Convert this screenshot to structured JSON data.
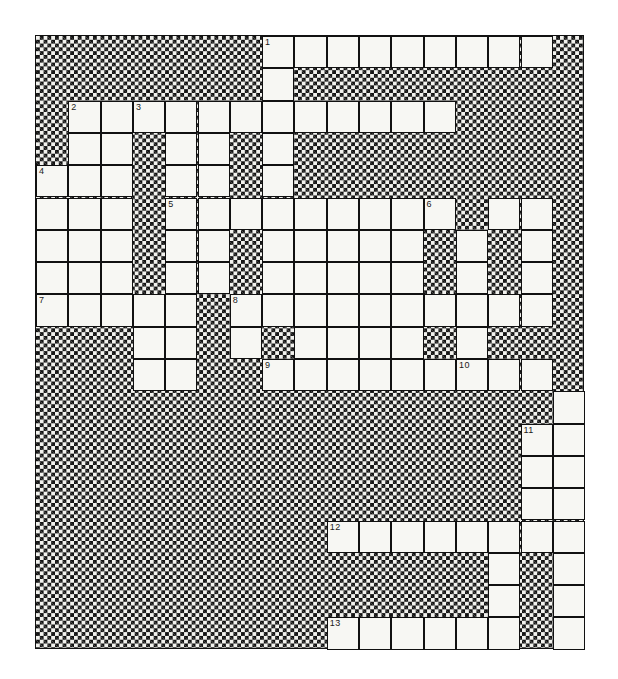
{
  "puzzle": {
    "title": "Crossword Puzzle Grid",
    "columns": 17,
    "rows": 19,
    "cell_size": 32.3,
    "origin_x": 35,
    "origin_y": 35,
    "colors": {
      "open_cell": "#f7f7f3",
      "blocked_cell": "#111111",
      "grid_line": "#111111",
      "page_background": "#ffffff",
      "number_text": "#1a1a1a"
    },
    "legend": {
      "open_symbol": ".",
      "blocked_symbol": "#"
    },
    "grid_rows": [
      "#######.........#",
      "#######.#########",
      "#............####",
      "#..#..#.#########",
      "...#..#.#########",
      "...#.........#..#",
      "...#..#.....#.#.#",
      "...#..#.....#.#.#",
      ".....#..........#",
      "###..#.#....#.###",
      "###..##.........#",
      "################.",
      "###############..",
      "###############..",
      "###############..",
      "#########........",
      "##############.#.",
      "##############.#.",
      "#########......#."
    ],
    "clue_numbers": [
      {
        "number": "1",
        "row": 0,
        "col": 7,
        "direction": "across-and-down"
      },
      {
        "number": "2",
        "row": 2,
        "col": 1,
        "direction": "across"
      },
      {
        "number": "3",
        "row": 2,
        "col": 3,
        "direction": "down"
      },
      {
        "number": "4",
        "row": 4,
        "col": 0,
        "direction": "down"
      },
      {
        "number": "5",
        "row": 5,
        "col": 4,
        "direction": "across"
      },
      {
        "number": "6",
        "row": 5,
        "col": 12,
        "direction": "down"
      },
      {
        "number": "7",
        "row": 8,
        "col": 0,
        "direction": "across"
      },
      {
        "number": "8",
        "row": 8,
        "col": 6,
        "direction": "across"
      },
      {
        "number": "9",
        "row": 10,
        "col": 7,
        "direction": "across"
      },
      {
        "number": "10",
        "row": 10,
        "col": 13,
        "direction": "down"
      },
      {
        "number": "11",
        "row": 12,
        "col": 15,
        "direction": "down"
      },
      {
        "number": "12",
        "row": 15,
        "col": 9,
        "direction": "across"
      },
      {
        "number": "13",
        "row": 18,
        "col": 9,
        "direction": "across"
      }
    ],
    "entries": {
      "across": [
        {
          "number": "1",
          "row": 0,
          "col": 7,
          "length": 9
        },
        {
          "number": "2",
          "row": 2,
          "col": 1,
          "length": 11
        },
        {
          "number": "5",
          "row": 5,
          "col": 4,
          "length": 9
        },
        {
          "number": "7",
          "row": 8,
          "col": 0,
          "length": 5
        },
        {
          "number": "8",
          "row": 8,
          "col": 6,
          "length": 10
        },
        {
          "number": "9",
          "row": 10,
          "col": 7,
          "length": 9
        },
        {
          "number": "12",
          "row": 15,
          "col": 9,
          "length": 8
        },
        {
          "number": "13",
          "row": 18,
          "col": 9,
          "length": 6
        }
      ],
      "down": [
        {
          "number": "1",
          "row": 0,
          "col": 7,
          "length": 9
        },
        {
          "number": "3",
          "row": 2,
          "col": 3,
          "length": 9
        },
        {
          "number": "4",
          "row": 4,
          "col": 0,
          "length": 5
        },
        {
          "number": "6",
          "row": 5,
          "col": 12,
          "length": 6
        },
        {
          "number": "10",
          "row": 10,
          "col": 13,
          "length": 9
        },
        {
          "number": "11",
          "row": 12,
          "col": 15,
          "length": 7
        }
      ]
    }
  }
}
